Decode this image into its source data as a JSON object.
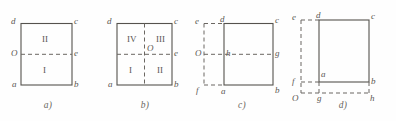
{
  "figure": {
    "stroke_color": "#55524d",
    "background_color": "#fefefe",
    "solid_line_style": "solid",
    "axis_line_style": "dashed"
  },
  "panels": [
    {
      "caption": "a)",
      "labels": {
        "top_left": "d",
        "top_right": "c",
        "left_mid": "O",
        "right_mid": "e",
        "bottom_left": "a",
        "bottom_right": "b"
      },
      "regions": {
        "upper": "II",
        "lower": "I"
      }
    },
    {
      "caption": "b)",
      "labels": {
        "top_left": "d",
        "top_right": "c",
        "center": "O",
        "right_mid": "e",
        "bottom_left": "a",
        "bottom_right": "b"
      },
      "regions": {
        "upper_left": "IV",
        "upper_right": "III",
        "lower_left": "I",
        "lower_right": "II"
      }
    },
    {
      "caption": "c)",
      "labels": {
        "axis_top_left": "e",
        "square_top_left": "d",
        "top_right": "c",
        "axis_left_mid": "O",
        "square_left_mid": "h",
        "right_mid": "g",
        "axis_bottom_left": "f",
        "square_bottom_left": "a",
        "bottom_right": "b"
      },
      "regions": {}
    },
    {
      "caption": "d)",
      "labels": {
        "axis_top_left": "e",
        "square_top_left": "d",
        "top_right": "c",
        "axis_left_mid": "f",
        "square_bottom_left": "a",
        "right_mid": "b",
        "origin": "O",
        "bottom_mid": "g",
        "bottom_right": "h"
      },
      "regions": {}
    }
  ]
}
